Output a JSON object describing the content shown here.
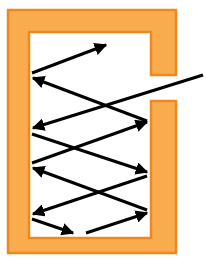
{
  "diagram": {
    "title": "",
    "colors": {
      "frame_fill": "#F9AC4E",
      "frame_edge": "#F0891D",
      "interior": "#FFFFFF",
      "arrow": "#000000",
      "background": "#FFFFFF"
    },
    "frame": {
      "shape": "open-box-with-slit",
      "slit_side": "right",
      "outer": {
        "x": 8,
        "y": 10,
        "w": 168,
        "h": 243
      },
      "inner": {
        "x": 29,
        "y": 32,
        "w": 122,
        "h": 206
      },
      "slit": {
        "y_top": 75,
        "y_bottom": 101
      }
    },
    "arrows": [
      {
        "id": "ray-1",
        "from": [
          32,
          73
        ],
        "to": [
          106,
          45
        ]
      },
      {
        "id": "ray-2",
        "from": [
          147,
          121
        ],
        "to": [
          33,
          78
        ]
      },
      {
        "id": "ray-3",
        "from": [
          203,
          75
        ],
        "to": [
          33,
          128
        ]
      },
      {
        "id": "ray-4",
        "from": [
          32,
          134
        ],
        "to": [
          147,
          172
        ]
      },
      {
        "id": "ray-5",
        "from": [
          32,
          163
        ],
        "to": [
          147,
          122
        ]
      },
      {
        "id": "ray-6",
        "from": [
          147,
          210
        ],
        "to": [
          33,
          168
        ]
      },
      {
        "id": "ray-7",
        "from": [
          147,
          176
        ],
        "to": [
          33,
          214
        ]
      },
      {
        "id": "ray-8",
        "from": [
          32,
          219
        ],
        "to": [
          73,
          233
        ]
      },
      {
        "id": "ray-9",
        "from": [
          86,
          233
        ],
        "to": [
          147,
          213
        ]
      }
    ]
  }
}
